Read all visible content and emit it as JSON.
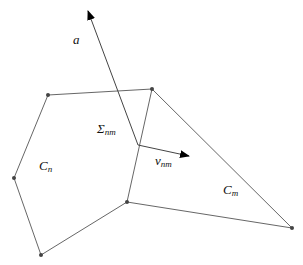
{
  "diagram": {
    "width": 303,
    "height": 265,
    "colors": {
      "edge": "#555555",
      "node": "#444444",
      "text": "#111111",
      "background": "#ffffff"
    },
    "nodes": [
      {
        "id": "p1",
        "x": 48,
        "y": 95
      },
      {
        "id": "p2",
        "x": 152,
        "y": 89
      },
      {
        "id": "p3",
        "x": 14,
        "y": 178
      },
      {
        "id": "p4",
        "x": 41,
        "y": 255
      },
      {
        "id": "p5",
        "x": 127,
        "y": 202
      },
      {
        "id": "p6",
        "x": 292,
        "y": 228
      }
    ],
    "junction": {
      "x": 138,
      "y": 145
    },
    "edges": [
      [
        "p1",
        "p2"
      ],
      [
        "p1",
        "p3"
      ],
      [
        "p3",
        "p4"
      ],
      [
        "p4",
        "p5"
      ],
      [
        "p5",
        "junction"
      ],
      [
        "junction",
        "p2"
      ],
      [
        "p2",
        "p6"
      ],
      [
        "p5",
        "p6"
      ]
    ],
    "vectors": {
      "a": {
        "from": [
          138,
          145
        ],
        "to": [
          88,
          11
        ],
        "label": "a"
      },
      "v_nm": {
        "from": [
          138,
          145
        ],
        "to": [
          189,
          156
        ],
        "label_main": "v",
        "label_sub": "nm"
      }
    },
    "labels": {
      "a": "a",
      "sigma_main": "Σ",
      "sigma_sub": "nm",
      "v_main": "v",
      "v_sub": "nm",
      "cn_main": "C",
      "cn_sub": "n",
      "cm_main": "C",
      "cm_sub": "m"
    }
  }
}
